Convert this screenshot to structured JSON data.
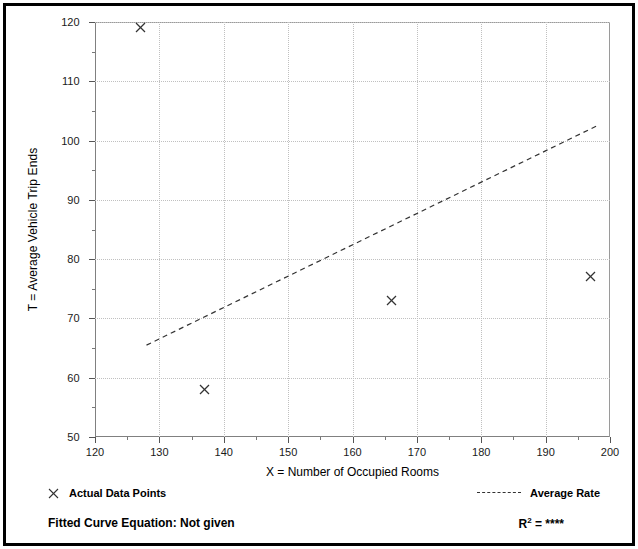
{
  "chart_data": {
    "type": "scatter",
    "title": "",
    "xlabel": "X = Number of Occupied Rooms",
    "ylabel": "T = Average Vehicle Trip Ends",
    "xlim": [
      120,
      200
    ],
    "ylim": [
      50,
      120
    ],
    "x_ticks": [
      120,
      130,
      140,
      150,
      160,
      170,
      180,
      190,
      200
    ],
    "y_ticks": [
      50,
      60,
      70,
      80,
      90,
      100,
      110,
      120
    ],
    "x_tick_labels": [
      "120",
      "130",
      "140",
      "150",
      "160",
      "170",
      "180",
      "190",
      "200"
    ],
    "y_tick_labels": [
      "50",
      "60",
      "70",
      "80",
      "90",
      "100",
      "110",
      "120"
    ],
    "x_minor_step": 5,
    "y_minor_step": 5,
    "grid": true,
    "grid_style": "dotted",
    "legend_position": "below-plot",
    "series": [
      {
        "name": "Actual Data Points",
        "type": "scatter",
        "marker": "x",
        "points": [
          {
            "x": 127,
            "y": 119
          },
          {
            "x": 137,
            "y": 58
          },
          {
            "x": 166,
            "y": 73
          },
          {
            "x": 197,
            "y": 77
          }
        ]
      },
      {
        "name": "Average Rate",
        "type": "line",
        "style": "dashed",
        "endpoints": [
          {
            "x": 128,
            "y": 65.5
          },
          {
            "x": 198,
            "y": 102.5
          }
        ]
      }
    ]
  },
  "legend": {
    "actual_data_points_label": "Actual Data Points",
    "average_rate_label": "Average Rate",
    "marker_icon": "x-marker-icon",
    "line_icon": "dashed-line-icon"
  },
  "footer": {
    "fitted_curve_equation": "Fitted Curve Equation:  Not given",
    "r2_prefix": "R",
    "r2_exponent": "2",
    "r2_value": " = ****"
  },
  "colors": {
    "axis": "#808080",
    "grid": "#c0c0c0",
    "marker": "#333333",
    "trend_line": "#333333",
    "frame": "#000000",
    "text": "#000000"
  }
}
